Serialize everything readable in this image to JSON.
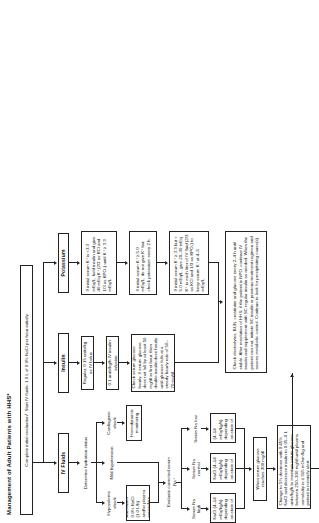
{
  "title": "Management of Adult Patients with HHS*",
  "start": {
    "label": "Complete initial evaluation¹. Start IV fluids: 1.0 L of 0.9% NaCl per hour initially."
  },
  "columns": {
    "iv_fluids": "IV Fluids",
    "insulin": "Insulin",
    "potassium": "Potassium"
  },
  "iv_fluids_branch": {
    "determine": "Determine hydration status",
    "options": [
      "Hypovolemic shock",
      "Mild hypotension",
      "Cardiogenic shock"
    ],
    "hypovolemic_action": "Administer 0.9% NaCl (1.0 L/h) and/or plasma expanders",
    "cardiogenic_action": "Hemodynamic monitoring",
    "evaluate_na": "Evaluate corrected serum Na⁺",
    "na_states": [
      "Serum Na high",
      "Serum Na normal",
      "Serum Na low"
    ],
    "na_high_action": "0.45% NaCl (4–14 mEq/kg/h) depending on state of hydration",
    "na_normal_action": "0.45% NaCl (4–14 mEq/kg/h) depending on state of hydration",
    "na_low_action": "0.9% NaCl (4–14 mEq/kg/h) depending on state of hydration",
    "glucose_trigger": "When serum glucose reaches 300 mg/dl",
    "dextrose_action": "Change to 5% dextrose with 0.45% NaCl and decrease insulin to 0.05–0.1 units/kg/h to maintain serum glucose between 250–300 mg/dl until plasma osmolality is ≤ 315 mOsm/kg and patient is mentally alert."
  },
  "insulin_branch": {
    "bolus": "Regular, 0.15 units/kg as IV bolus",
    "infusion": "0.1 units/kg/h IV insulin infusion",
    "monitor": "Check serum glucose hourly. If serum glucose does not fall by at least 50 mg/dl in first hour, then double insulin dose hourly until glucose falls at a steady hourly rate of 50–70 mg/dl."
  },
  "potassium_branch": {
    "low": "If initial serum K⁺ is <3.3 mEq/L, hold insulin and give 40 mEq K⁺ (2/3 as KCl and 1/3 as KPO₄) until K⁺ ≥ 3.3 mEq/L.",
    "high": "If initial serum K⁺ ≥ 5.0 mEq/L, do not give K⁺ but check potassium every 2 h.",
    "mid": "If initial serum K⁺ ≥ 3.3 but < 5.0 mEq/L, give 20–30 mEq K⁺ in each liter of IV fluid (2/3 as KCl and 1/3 as KPO₄) to keep serum K⁺ at 4–5 mEq/L."
  },
  "footer": {
    "monitoring": "Check electrolytes, BUN, creatinine and glucose every 2–4 h until stable. After resolution of HHS, if the patient is NPO, continue IV insulin and supplement with SC regular insulin as needed. When the patient can eat, initiate SC insulin or previous treatment regimen and assess metabolic control. Continue to look for precipitating cause(s)."
  }
}
